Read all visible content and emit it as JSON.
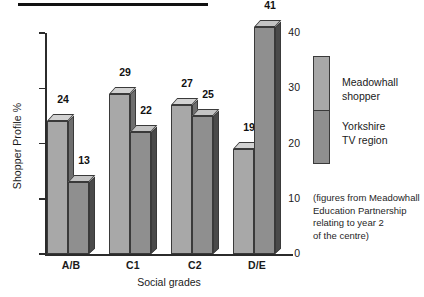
{
  "figure": {
    "top_rule": "horizontal-rule",
    "caption_lines": [
      "(figures from Meadowhall",
      "Education Partnership",
      "relating to year 2",
      "of the centre)"
    ]
  },
  "legend": {
    "position": "right",
    "entries": [
      {
        "label_line1": "Meadowhall",
        "label_line2": "shopper",
        "color": "#a8a8a8"
      },
      {
        "label_line1": "Yorkshire",
        "label_line2": "TV region",
        "color": "#8f8f8f"
      }
    ]
  },
  "colors": {
    "series_0_front": "#a8a8a8",
    "series_0_top": "#d2d2d2",
    "series_0_side": "#6e6e6e",
    "series_1_front": "#8f8f8f",
    "series_1_top": "#c4c4c4",
    "series_1_side": "#4a4a4a",
    "axis": "#2b2b2b",
    "rule": "#111111"
  },
  "chart_data": {
    "type": "bar",
    "title": "",
    "subtitle": "",
    "xlabel": "Social grades",
    "ylabel": "Shopper Profile %",
    "categories": [
      "A/B",
      "C1",
      "C2",
      "D/E"
    ],
    "series": [
      {
        "name": "Meadowhall shopper",
        "values": [
          24,
          29,
          27,
          19
        ]
      },
      {
        "name": "Yorkshire TV region",
        "values": [
          13,
          22,
          25,
          41
        ]
      }
    ],
    "ylim": [
      0,
      40
    ],
    "yticks": [
      0,
      10,
      20,
      30,
      40
    ],
    "ytick_labels": [
      "0",
      "10",
      "20",
      "30",
      "40"
    ],
    "grid": false,
    "data_labels": true,
    "three_d": true,
    "legend_position": "right",
    "annotation": "(figures from Meadowhall Education Partnership relating to year 2 of the centre)"
  }
}
